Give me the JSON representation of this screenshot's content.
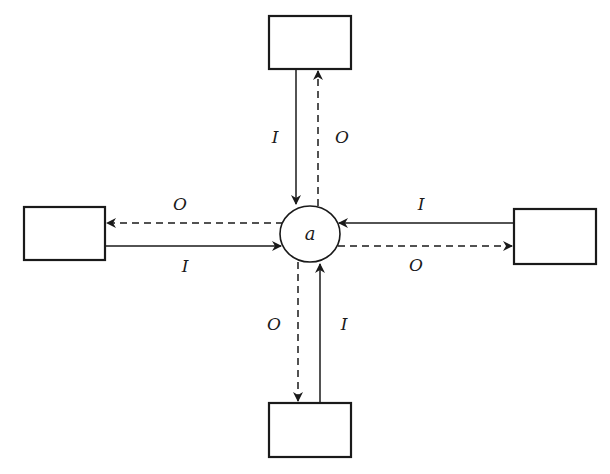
{
  "diagram": {
    "center_node": {
      "label": "a"
    },
    "boxes": [
      {
        "id": "top",
        "label": ""
      },
      {
        "id": "left",
        "label": ""
      },
      {
        "id": "right",
        "label": ""
      },
      {
        "id": "bottom",
        "label": ""
      }
    ],
    "edges": [
      {
        "from": "top",
        "to": "a",
        "style": "solid",
        "label": "I"
      },
      {
        "from": "a",
        "to": "top",
        "style": "dashed",
        "label": "O"
      },
      {
        "from": "a",
        "to": "left",
        "style": "dashed",
        "label": "O"
      },
      {
        "from": "left",
        "to": "a",
        "style": "solid",
        "label": "I"
      },
      {
        "from": "right",
        "to": "a",
        "style": "solid",
        "label": "I"
      },
      {
        "from": "a",
        "to": "right",
        "style": "dashed",
        "label": "O"
      },
      {
        "from": "a",
        "to": "bottom",
        "style": "dashed",
        "label": "O"
      },
      {
        "from": "bottom",
        "to": "a",
        "style": "solid",
        "label": "I"
      }
    ],
    "legend_meaning": {
      "I": "input (solid arrow)",
      "O": "output (dashed arrow)"
    }
  }
}
